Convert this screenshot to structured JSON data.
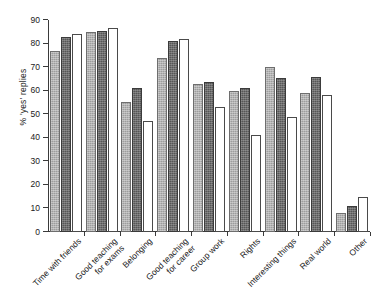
{
  "chart_data": {
    "type": "bar",
    "title": "",
    "xlabel": "",
    "ylabel": "% 'yes' replies",
    "ylim": [
      0,
      90
    ],
    "yticks": [
      0,
      10,
      20,
      30,
      40,
      50,
      60,
      70,
      80,
      90
    ],
    "ytick_labels": [
      "0",
      "10",
      "20",
      "30",
      "40",
      "50",
      "60",
      "70",
      "80",
      "90"
    ],
    "grid": false,
    "legend": "none",
    "categories": [
      "Time with friends",
      "Good teaching\nfor exams",
      "Belonging",
      "Good teaching\nfor career",
      "Group work",
      "Rights",
      "Interesting things",
      "Real world",
      "Other"
    ],
    "series": [
      {
        "name": "series-1",
        "fill": "light-grey-hatched",
        "values": [
          77,
          85,
          55,
          74,
          63,
          60,
          70,
          59,
          8
        ]
      },
      {
        "name": "series-2",
        "fill": "dark-grey-hatched",
        "values": [
          83,
          85.5,
          61,
          81,
          63.5,
          61,
          65.5,
          66,
          11
        ]
      },
      {
        "name": "series-3",
        "fill": "white",
        "values": [
          84,
          86.5,
          47,
          82,
          53,
          41,
          49,
          58,
          15
        ]
      }
    ]
  }
}
